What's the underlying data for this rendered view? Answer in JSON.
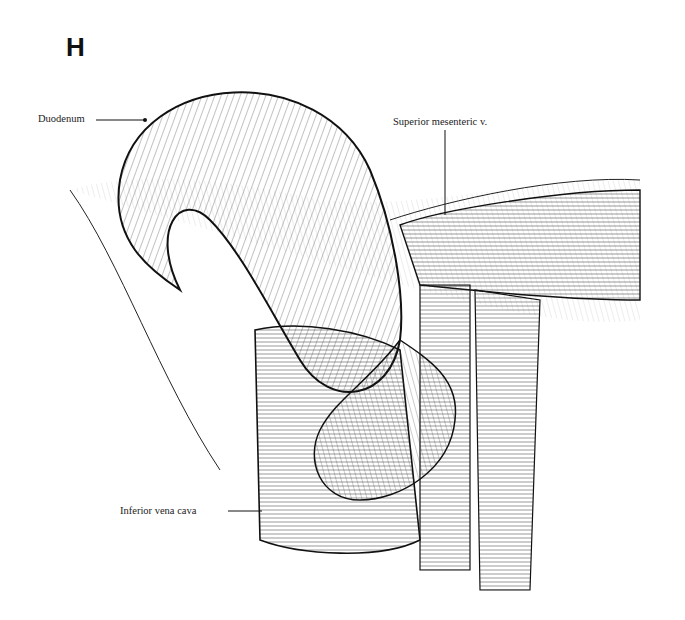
{
  "figure": {
    "panel_letter": "H",
    "labels": {
      "duodenum": "Duodenum",
      "superior_mesenteric_v": "Superior mesenteric v.",
      "inferior_vena_cava": "Inferior vena cava"
    }
  }
}
